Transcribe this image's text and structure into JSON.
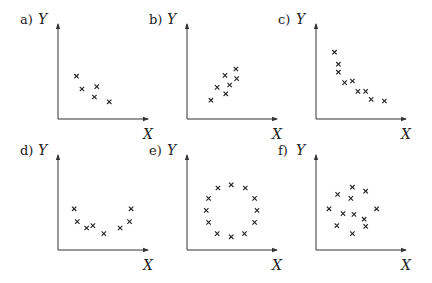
{
  "chart_data": [
    {
      "type": "scatter",
      "panel": "a)",
      "xlabel": "X",
      "ylabel": "Y",
      "marker": "x",
      "xlim": [
        0,
        10
      ],
      "ylim": [
        0,
        10
      ],
      "grid": false,
      "points": [
        [
          1.6,
          4.6
        ],
        [
          2.3,
          3.0
        ],
        [
          4.2,
          3.3
        ],
        [
          3.9,
          2.0
        ],
        [
          5.8,
          1.4
        ]
      ]
    },
    {
      "type": "scatter",
      "panel": "b)",
      "xlabel": "X",
      "ylabel": "Y",
      "marker": "x",
      "xlim": [
        0,
        10
      ],
      "ylim": [
        0,
        10
      ],
      "grid": false,
      "points": [
        [
          2.3,
          1.6
        ],
        [
          3.1,
          3.2
        ],
        [
          4.1,
          4.7
        ],
        [
          4.2,
          2.4
        ],
        [
          4.7,
          3.5
        ],
        [
          5.5,
          5.5
        ],
        [
          5.6,
          4.3
        ]
      ]
    },
    {
      "type": "scatter",
      "panel": "c)",
      "xlabel": "X",
      "ylabel": "Y",
      "marker": "x",
      "xlim": [
        0,
        10
      ],
      "ylim": [
        0,
        10
      ],
      "grid": false,
      "points": [
        [
          1.6,
          7.6
        ],
        [
          2.1,
          6.1
        ],
        [
          2.1,
          5.1
        ],
        [
          2.9,
          3.8
        ],
        [
          3.9,
          4.0
        ],
        [
          4.6,
          2.7
        ],
        [
          5.6,
          2.7
        ],
        [
          6.3,
          1.7
        ],
        [
          8.0,
          1.5
        ]
      ]
    },
    {
      "type": "scatter",
      "panel": "d)",
      "xlabel": "X",
      "ylabel": "Y",
      "marker": "x",
      "xlim": [
        0,
        10
      ],
      "ylim": [
        0,
        10
      ],
      "grid": false,
      "points": [
        [
          1.3,
          4.4
        ],
        [
          1.7,
          2.8
        ],
        [
          2.9,
          2.0
        ],
        [
          3.7,
          2.3
        ],
        [
          5.1,
          1.3
        ],
        [
          7.2,
          2.0
        ],
        [
          8.4,
          2.8
        ],
        [
          8.6,
          4.4
        ]
      ]
    },
    {
      "type": "scatter",
      "panel": "e)",
      "xlabel": "X",
      "ylabel": "Y",
      "marker": "x",
      "xlim": [
        0,
        10
      ],
      "ylim": [
        0,
        10
      ],
      "grid": false,
      "points": [
        [
          3.2,
          7.0
        ],
        [
          4.9,
          7.4
        ],
        [
          6.7,
          7.0
        ],
        [
          2.0,
          5.7
        ],
        [
          7.9,
          5.7
        ],
        [
          1.7,
          4.2
        ],
        [
          8.2,
          4.2
        ],
        [
          2.0,
          2.7
        ],
        [
          7.9,
          2.7
        ],
        [
          3.1,
          1.3
        ],
        [
          4.9,
          0.9
        ],
        [
          6.6,
          1.3
        ]
      ]
    },
    {
      "type": "scatter",
      "panel": "f)",
      "xlabel": "X",
      "ylabel": "Y",
      "marker": "x",
      "xlim": [
        0,
        10
      ],
      "ylim": [
        0,
        10
      ],
      "grid": false,
      "points": [
        [
          2.0,
          6.2
        ],
        [
          3.9,
          7.1
        ],
        [
          3.7,
          5.7
        ],
        [
          5.6,
          6.6
        ],
        [
          0.9,
          4.4
        ],
        [
          2.7,
          3.8
        ],
        [
          4.1,
          3.7
        ],
        [
          5.4,
          3.1
        ],
        [
          7.0,
          4.4
        ],
        [
          1.9,
          2.3
        ],
        [
          5.6,
          2.2
        ],
        [
          3.9,
          1.3
        ]
      ]
    }
  ]
}
